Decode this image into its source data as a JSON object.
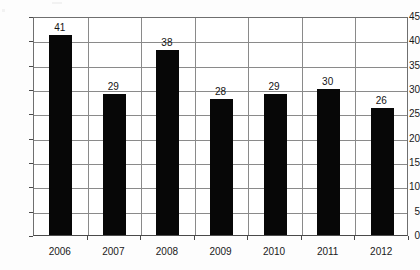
{
  "chart_data": {
    "type": "bar",
    "title": "",
    "subtitle": "",
    "xlabel": "",
    "ylabel": "",
    "categories": [
      "2006",
      "2007",
      "2008",
      "2009",
      "2010",
      "2011",
      "2012"
    ],
    "values": [
      41,
      29,
      38,
      28,
      29,
      30,
      26
    ],
    "series": [
      {
        "name": "",
        "values": [
          41,
          29,
          38,
          28,
          29,
          30,
          26
        ]
      }
    ],
    "data_labels": [
      "41",
      "29",
      "38",
      "28",
      "29",
      "30",
      "26"
    ],
    "ylim": [
      0,
      45
    ],
    "y_ticks": [
      0,
      5,
      10,
      15,
      20,
      25,
      30,
      35,
      40,
      45
    ],
    "y_tick_labels": [
      "0",
      "5",
      "10",
      "15",
      "20",
      "25",
      "30",
      "35",
      "40",
      "45"
    ],
    "grid": "horizontal-and-category-separators",
    "legend": "none",
    "legend_entries": [],
    "bar_color": "#070707",
    "grid_color": "#8a8a8a",
    "axis_color": "#4a4a4a",
    "background_color": "#ffffff",
    "annotations": []
  }
}
